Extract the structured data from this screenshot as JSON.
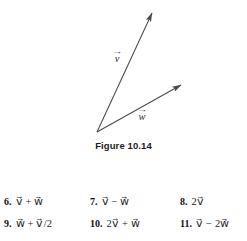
{
  "figure": {
    "caption": "Figure 10.14",
    "background_color": "#ffffff",
    "stroke_color": "#4a4a4a",
    "vectors": [
      {
        "name": "v",
        "label": "v⃗",
        "label_text": "v",
        "origin": [
          97,
          132
        ],
        "tip": [
          152,
          13
        ],
        "label_position": [
          118,
          58
        ]
      },
      {
        "name": "w",
        "label": "w⃗",
        "label_text": "w",
        "origin": [
          97,
          132
        ],
        "tip": [
          181,
          85
        ],
        "label_position": [
          143,
          116
        ]
      }
    ]
  },
  "exercises": {
    "rows": [
      [
        {
          "number": "6.",
          "expression": "v⃗ + w⃗"
        },
        {
          "number": "7.",
          "expression": "v⃗ − w⃗"
        },
        {
          "number": "8.",
          "expression": "2v⃗"
        }
      ],
      [
        {
          "number": "9.",
          "expression": "w⃗ + v⃗/2"
        },
        {
          "number": "10.",
          "expression": "2v⃗ + w⃗"
        },
        {
          "number": "11.",
          "expression": "v⃗ − 2w⃗"
        }
      ]
    ]
  }
}
